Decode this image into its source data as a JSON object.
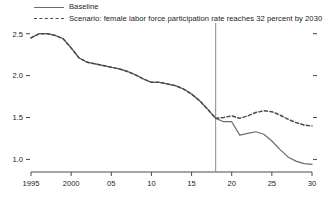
{
  "legend": {
    "items": [
      {
        "label": "Baseline",
        "style": "solid",
        "color": "#6b6b6b",
        "name": "legend-item-baseline"
      },
      {
        "label": "Scenario: female labor force participation rate reaches 32 percent by 2030",
        "style": "dashed",
        "color": "#4a4a4a",
        "name": "legend-item-scenario"
      }
    ]
  },
  "chart_data": {
    "type": "line",
    "title": "",
    "xlabel": "",
    "ylabel": "",
    "xlim": [
      1995,
      2030
    ],
    "ylim": [
      0.85,
      2.58
    ],
    "grid": false,
    "legend_position": "top",
    "xticks": [
      1995,
      2000,
      2005,
      2010,
      2015,
      2020,
      2025,
      2030
    ],
    "xticklabels": [
      "1995",
      "2000",
      "05",
      "10",
      "15",
      "20",
      "25",
      "30"
    ],
    "yticks": [
      1.0,
      1.5,
      2.0,
      2.5
    ],
    "yticklabels": [
      "1.0",
      "1.5",
      "2.0",
      "2.5"
    ],
    "annotations": [
      {
        "type": "vline",
        "x": 2018,
        "label": "",
        "color": "#8a8a8a"
      }
    ],
    "x": [
      1995,
      1996,
      1997,
      1998,
      1999,
      2000,
      2001,
      2002,
      2003,
      2004,
      2005,
      2006,
      2007,
      2008,
      2009,
      2010,
      2011,
      2012,
      2013,
      2014,
      2015,
      2016,
      2017,
      2018,
      2019,
      2020,
      2021,
      2022,
      2023,
      2024,
      2025,
      2026,
      2027,
      2028,
      2029,
      2030
    ],
    "series": [
      {
        "name": "Baseline",
        "style": "solid",
        "color": "#6b6b6b",
        "values": [
          2.45,
          2.5,
          2.5,
          2.48,
          2.44,
          2.33,
          2.21,
          2.16,
          2.14,
          2.12,
          2.1,
          2.08,
          2.05,
          2.01,
          1.96,
          1.92,
          1.92,
          1.9,
          1.88,
          1.84,
          1.78,
          1.7,
          1.6,
          1.49,
          1.45,
          1.45,
          1.29,
          1.31,
          1.33,
          1.3,
          1.22,
          1.12,
          1.03,
          0.98,
          0.95,
          0.94
        ]
      },
      {
        "name": "Scenario: female labor force participation rate reaches 32 percent by 2030",
        "style": "dashed",
        "color": "#4a4a4a",
        "values": [
          2.45,
          2.5,
          2.5,
          2.48,
          2.44,
          2.33,
          2.21,
          2.16,
          2.14,
          2.12,
          2.1,
          2.08,
          2.05,
          2.01,
          1.96,
          1.92,
          1.92,
          1.9,
          1.88,
          1.84,
          1.78,
          1.7,
          1.6,
          1.49,
          1.5,
          1.52,
          1.49,
          1.52,
          1.56,
          1.58,
          1.57,
          1.53,
          1.48,
          1.44,
          1.41,
          1.4
        ]
      }
    ]
  }
}
